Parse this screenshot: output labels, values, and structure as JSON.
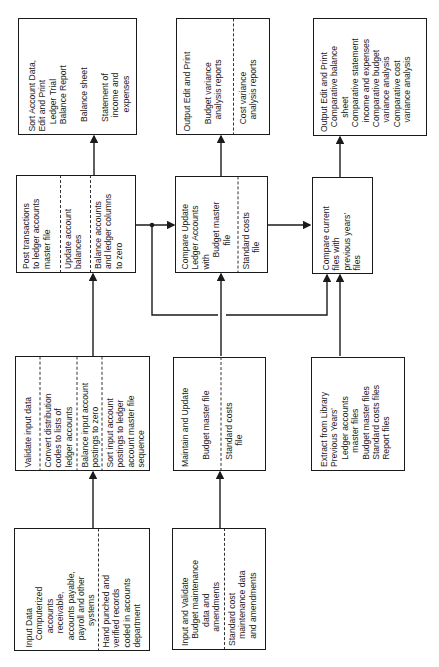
{
  "diagram": {
    "orientation": "rotated -90deg (text reads bottom-to-top)",
    "boxes": {
      "sort_account_data": {
        "sections": [
          {
            "text": "Sort Account Data,\nEdit and Print\n   Ledger Trial\n   Balance Report\n\n    Balance sheet\n\n    Statement of\n      income and\n        expenses"
          }
        ]
      },
      "output_edit_budget": {
        "sections": [
          {
            "text": "Output Edit and Print\n\n   Budget variance\n     analysis reports"
          },
          {
            "text": "   Cost variance\n     analysis reports"
          }
        ]
      },
      "output_edit_comparative": {
        "sections": [
          {
            "text": "Output Edit and Print\n  Comparative balance\n      sheet\n  Comparative statement\n    income and expenses\n  Comparative budget\n    variance analysis\n  Comparative cost\n    variance analysis"
          }
        ]
      },
      "post_transactions": {
        "sections": [
          {
            "text": "Post transactions\nto ledger accounts\nmaster file"
          },
          {
            "text": "Update account\nbalances"
          },
          {
            "text": "Balance accounts\nand ledger columns\nto zero"
          }
        ]
      },
      "compare_update": {
        "sections": [
          {
            "text": "Compare Update\nLedger Accounts\nwith\n     Budget master\n          file"
          },
          {
            "text": "Standard costs\n       file"
          }
        ]
      },
      "compare_current": {
        "sections": [
          {
            "text": "Compare current\nfiles with\nprevious years'\nfiles"
          }
        ]
      },
      "validate_input": {
        "sections": [
          {
            "text": "Validate input data"
          },
          {
            "text": "Convert distribution\ncodes to lists of\nledger accounts"
          },
          {
            "text": "Balance input account\npostings to zero"
          },
          {
            "text": "Sort input account\npostings to ledger\naccount master file\nsequence"
          }
        ]
      },
      "maintain_update": {
        "sections": [
          {
            "text": "Maintain and Update\n\n   Budget master file"
          },
          {
            "text": "   Standard costs\n         file"
          }
        ]
      },
      "extract_library": {
        "sections": [
          {
            "text": "Extract from Library\nPrevious Years'\n   Ledger accounts\n      master files\n   Budget master files\n   Standard costs files\n   Report files"
          }
        ]
      },
      "input_data": {
        "sections": [
          {
            "text": "Input Data\n   Computerized\n      accounts\n      receivable,\n   accounts payable,\n   payroll and other\n         systems"
          },
          {
            "text": "Hand punched and\nverified records\ncoded in accounts\ndepartment"
          }
        ]
      },
      "input_validate": {
        "sections": [
          {
            "text": "Input and Validate\n   Budget maintenance\n        data and\n      amendments"
          },
          {
            "text": "Standard cost\n   maintenance data\n   and amendments"
          }
        ]
      }
    },
    "connections": [
      {
        "from": "input_data",
        "to": "validate_input"
      },
      {
        "from": "validate_input",
        "to": "post_transactions"
      },
      {
        "from": "post_transactions",
        "to": "sort_account_data"
      },
      {
        "from": "post_transactions",
        "to": "compare_update"
      },
      {
        "from": "post_transactions",
        "to": "compare_current"
      },
      {
        "from": "input_validate",
        "to": "maintain_update"
      },
      {
        "from": "maintain_update",
        "to": "compare_update"
      },
      {
        "from": "compare_update",
        "to": "output_edit_budget"
      },
      {
        "from": "compare_update",
        "to": "compare_current"
      },
      {
        "from": "extract_library",
        "to": "compare_current"
      },
      {
        "from": "compare_current",
        "to": "output_edit_comparative"
      }
    ],
    "colors": {
      "line": "#1a1a1a",
      "background": "#ffffff"
    }
  }
}
